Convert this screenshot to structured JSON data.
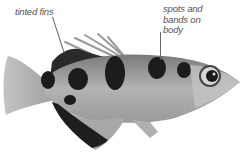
{
  "image": {
    "subject": "archerfish",
    "style": "grayscale photo"
  },
  "annotations": [
    {
      "id": "fins",
      "text": "tinted fins"
    },
    {
      "id": "spots",
      "text": "spots and bands on body"
    }
  ],
  "colors": {
    "background": "#ffffff",
    "label": "#555555",
    "fish_light": "#b8b8b8",
    "fish_mid": "#8a8a8a",
    "spot": "#1c1c1c"
  }
}
